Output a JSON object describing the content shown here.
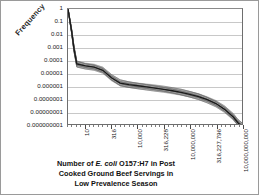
{
  "chart_data": {
    "type": "line",
    "title_lines": [
      "Number of  E. coli O157:H7 in Post",
      "Cooked Ground Beef Servings in",
      "Low Prevalence Season"
    ],
    "title_italic_segment": "E. coli",
    "xlabel": "Number of  E. coli O157:H7 in Post Cooked Ground Beef Servings in Low Prevalence Season",
    "ylabel": "Frequency",
    "xscale": "log",
    "yscale": "log",
    "grid": true,
    "legend": "none",
    "ylim": [
      1e-09,
      1
    ],
    "yticks": [
      1,
      0.1,
      0.01,
      0.001,
      0.0001,
      1e-05,
      1e-06,
      1e-07,
      1e-08,
      1e-09
    ],
    "ytick_labels": [
      "1",
      "0.1",
      "0.01",
      "0.001",
      "0.0001",
      "0.00001",
      "0.000001",
      "0.0000001",
      "0.00000001",
      "0.000000001"
    ],
    "xlim": [
      1,
      10000000000
    ],
    "xticks": [
      10,
      316,
      10000,
      316228,
      10000000,
      316227796,
      10000000000
    ],
    "xtick_labels": [
      "10",
      "316",
      "10,000",
      "316,228",
      "10,000,000",
      "316,227,796",
      "10,000,000,000"
    ],
    "series": [
      {
        "name": "median",
        "color": "#1a1a1a",
        "x": [
          1,
          1.6,
          2.2,
          3.2,
          10,
          32,
          100,
          316,
          1000,
          3162,
          10000,
          31623,
          100000,
          316228,
          1000000,
          3162278,
          10000000,
          31622776,
          100000000,
          316227796,
          1000000000,
          3162277660,
          6000000000,
          10000000000
        ],
        "y": [
          1,
          0.02,
          0.0008,
          5e-05,
          3.5e-05,
          2.8e-05,
          1.6e-05,
          4.2e-06,
          1.6e-06,
          1.2e-06,
          9.8e-07,
          8e-07,
          6.5e-07,
          5.2e-07,
          4e-07,
          3e-07,
          2.1e-07,
          1.4e-07,
          8e-08,
          4e-08,
          1.4e-08,
          3.5e-09,
          1.2e-09,
          7e-10
        ]
      },
      {
        "name": "upper-band",
        "color": "#6d6d6d",
        "x": [
          1,
          1.6,
          2.2,
          3.2,
          10,
          32,
          100,
          316,
          1000,
          3162,
          10000,
          31623,
          100000,
          316228,
          1000000,
          3162278,
          10000000,
          31622776,
          100000000,
          316227796,
          1000000000,
          3162277660,
          6000000000,
          10000000000
        ],
        "y": [
          1,
          0.03,
          0.0014,
          9e-05,
          6e-05,
          4.8e-05,
          2.8e-05,
          7.5e-06,
          2.9e-06,
          2.1e-06,
          1.7e-06,
          1.4e-06,
          1.15e-06,
          9.2e-07,
          7e-07,
          5.3e-07,
          3.7e-07,
          2.5e-07,
          1.4e-07,
          7e-08,
          2.6e-08,
          6.5e-09,
          2.2e-09,
          1.3e-09
        ]
      },
      {
        "name": "lower-band",
        "color": "#6d6d6d",
        "x": [
          1,
          1.6,
          2.2,
          3.2,
          10,
          32,
          100,
          316,
          1000,
          3162,
          10000,
          31623,
          100000,
          316228,
          1000000,
          3162278,
          10000000,
          31622776,
          100000000,
          316227796,
          1000000000,
          3162277660,
          6000000000,
          10000000000
        ],
        "y": [
          1,
          0.013,
          0.00045,
          2.8e-05,
          2e-05,
          1.6e-05,
          9.2e-06,
          2.4e-06,
          9e-07,
          6.8e-07,
          5.6e-07,
          4.6e-07,
          3.7e-07,
          3e-07,
          2.3e-07,
          1.7e-07,
          1.2e-07,
          8e-08,
          4.5e-08,
          2.2e-08,
          7.8e-09,
          2e-09,
          6.8e-10,
          4e-10
        ]
      }
    ],
    "band_description": "dense bundle of simulation iteration curves forming a gray band around the dark median line"
  }
}
